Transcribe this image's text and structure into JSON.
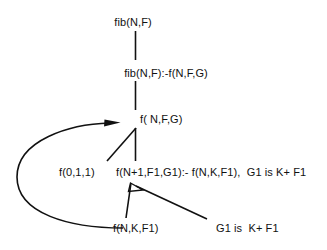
{
  "diagram": {
    "background_color": "#ffffff",
    "ink_color": "#111111",
    "nodes": [
      {
        "id": "root",
        "label": "fib(N,F)"
      },
      {
        "id": "clause",
        "label": "fib(N,F):-f(N,F,G)"
      },
      {
        "id": "goal",
        "label": "f( N,F,G)"
      },
      {
        "id": "base",
        "label": "f(0,1,1)"
      },
      {
        "id": "rec",
        "label": "f(N+1,F1,G1):- f(N,K,F1),  G1 is K+ F1"
      },
      {
        "id": "sub",
        "label": "f(N,K,F1)"
      },
      {
        "id": "arith",
        "label": "G1 is  K+ F1"
      }
    ],
    "edges": [
      {
        "id": "root-to-clause",
        "from": "root",
        "to": "clause",
        "style": "vertical-line",
        "arrow": false
      },
      {
        "id": "clause-to-goal",
        "from": "clause",
        "to": "goal",
        "style": "vertical-line",
        "arrow": false
      },
      {
        "id": "goal-to-base",
        "from": "goal",
        "to": "base",
        "style": "diagonal-line",
        "arrow": false
      },
      {
        "id": "goal-to-rec",
        "from": "goal",
        "to": "rec",
        "style": "vertical-line",
        "arrow": false
      },
      {
        "id": "rec-to-sub",
        "from": "rec",
        "to": "sub",
        "style": "diagonal-line",
        "arrow": true
      },
      {
        "id": "rec-to-arith",
        "from": "rec",
        "to": "arith",
        "style": "diagonal-line",
        "arrow": false
      },
      {
        "id": "sub-back-to-goal",
        "from": "sub",
        "to": "goal",
        "style": "curved-loop",
        "arrow": true
      }
    ]
  }
}
